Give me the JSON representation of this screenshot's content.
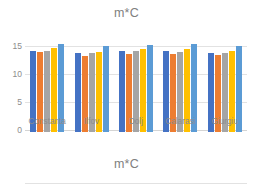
{
  "charts": [
    {
      "title": "m*C",
      "yticks": [
        "15",
        "10",
        "5",
        "0"
      ]
    },
    {
      "title": "m*C",
      "yticks": [
        "15"
      ]
    }
  ],
  "chart_data": [
    {
      "type": "bar",
      "title": "m*C",
      "xlabel": "",
      "ylabel": "",
      "ylim": [
        0,
        15
      ],
      "yticks": [
        0,
        5,
        10,
        15
      ],
      "grid": true,
      "legend": "none",
      "categories": [
        "Constanta",
        "Ilfov",
        "Dolj",
        "Calarasi",
        "Giurgiu"
      ],
      "series": [
        {
          "name": "Series 1",
          "color": "#4472C4",
          "values": [
            11.0,
            10.7,
            11.0,
            11.0,
            10.7
          ]
        },
        {
          "name": "Series 2",
          "color": "#ED7D31",
          "values": [
            10.8,
            10.3,
            10.6,
            10.6,
            10.4
          ]
        },
        {
          "name": "Series 3",
          "color": "#A5A5A5",
          "values": [
            11.0,
            10.7,
            11.0,
            10.8,
            10.7
          ]
        },
        {
          "name": "Series 4",
          "color": "#FFC000",
          "values": [
            11.4,
            10.9,
            11.3,
            11.2,
            11.0
          ]
        },
        {
          "name": "Series 5",
          "color": "#5B9BD5",
          "values": [
            12.0,
            11.6,
            11.8,
            12.0,
            11.7
          ]
        }
      ]
    },
    {
      "type": "bar",
      "title": "m*C",
      "xlabel": "",
      "ylabel": "",
      "ylim": [
        0,
        15
      ],
      "yticks": [
        15
      ],
      "grid": true,
      "legend": "none",
      "categories": [],
      "series": []
    }
  ]
}
